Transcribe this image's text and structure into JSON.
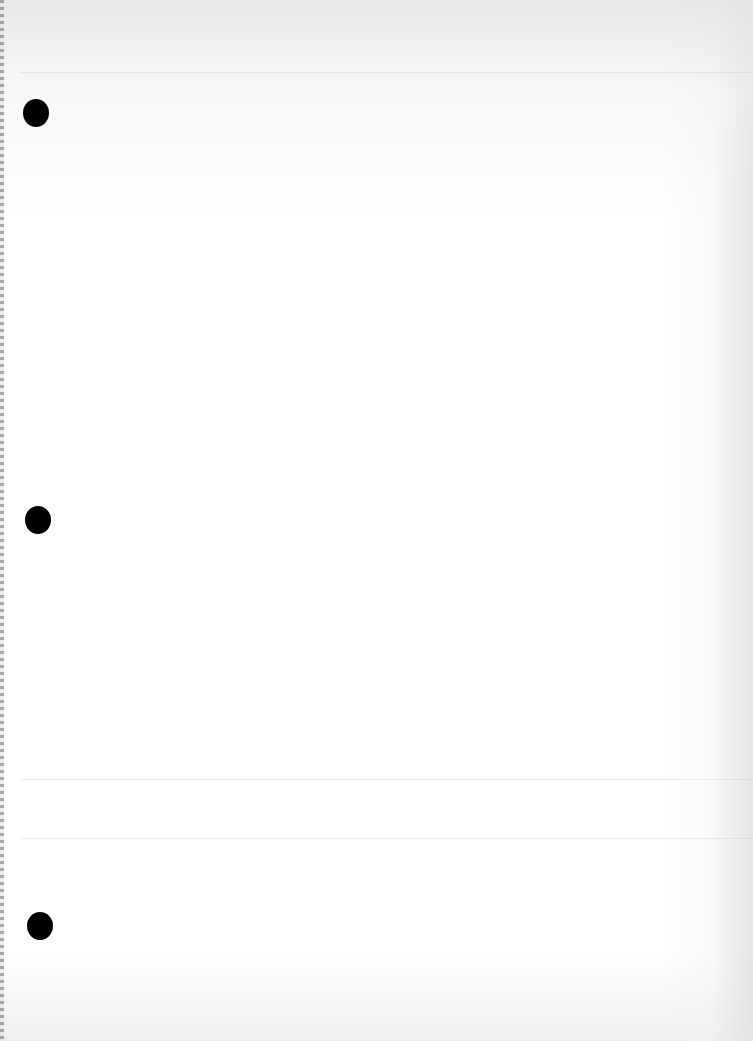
{
  "page": {
    "type": "blank-paper-scan",
    "background_color": "#ffffff",
    "punch_holes": [
      {
        "cx": 36,
        "cy": 113,
        "w": 26,
        "h": 28
      },
      {
        "cx": 38,
        "cy": 520,
        "w": 26,
        "h": 28
      },
      {
        "cx": 40,
        "cy": 926,
        "w": 26,
        "h": 28
      }
    ],
    "hole_color": "#000000"
  }
}
